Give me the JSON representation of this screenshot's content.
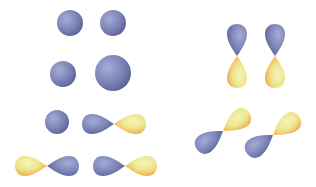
{
  "diagram": {
    "title": "",
    "colors": {
      "negative_phase": "#7f86b8",
      "positive_phase": "#eee79a",
      "positive_edge": "#f0a850",
      "background": "#ffffff"
    },
    "left_panel": {
      "spheres": [
        {
          "cx": 70,
          "cy": 23,
          "r": 13
        },
        {
          "cx": 113,
          "cy": 23,
          "r": 13
        },
        {
          "cx": 63,
          "cy": 74,
          "r": 13
        },
        {
          "cx": 113,
          "cy": 73,
          "r": 18
        },
        {
          "cx": 57,
          "cy": 122,
          "r": 12
        }
      ],
      "horizontal_p_orbitals": [
        {
          "cx": 114,
          "cy": 124,
          "blue_side": "left"
        },
        {
          "cx": 47,
          "cy": 166,
          "blue_side": "right"
        },
        {
          "cx": 125,
          "cy": 166,
          "blue_side": "left"
        }
      ]
    },
    "right_panel": {
      "vertical_p_orbitals": [
        {
          "cx": 237,
          "cy": 57,
          "blue_side": "top"
        },
        {
          "cx": 275,
          "cy": 57,
          "blue_side": "top"
        }
      ],
      "diagonal_p_orbitals": [
        {
          "cx": 223,
          "cy": 130,
          "angle": -40
        },
        {
          "cx": 273,
          "cy": 134,
          "angle": -40
        }
      ]
    }
  }
}
